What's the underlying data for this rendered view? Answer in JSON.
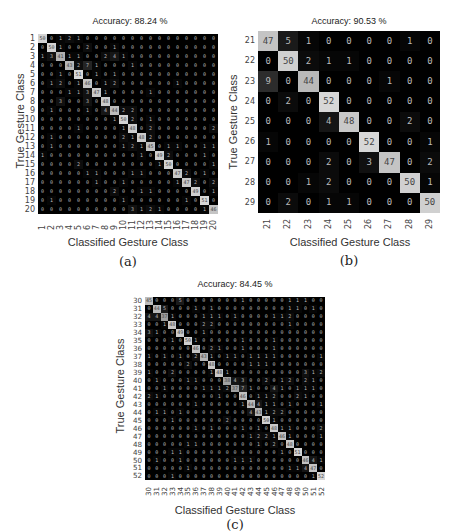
{
  "panels": {
    "a": {
      "caption": "(a)"
    },
    "b": {
      "caption": "(b)"
    },
    "c": {
      "caption": "(c)"
    }
  },
  "chart_data": [
    {
      "type": "heatmap",
      "id": "a",
      "title": "Accuracy: 88.24 %",
      "xlabel": "Classified Gesture Class",
      "ylabel": "True Gesture Class",
      "labels": [
        "1",
        "2",
        "3",
        "4",
        "5",
        "6",
        "7",
        "8",
        "9",
        "10",
        "11",
        "12",
        "13",
        "14",
        "15",
        "16",
        "17",
        "18",
        "19",
        "20"
      ],
      "matrix": [
        [
          50,
          0,
          1,
          2,
          1,
          0,
          0,
          0,
          0,
          0,
          0,
          0,
          0,
          0,
          0,
          0,
          0,
          0,
          0,
          0
        ],
        [
          0,
          50,
          1,
          0,
          0,
          2,
          0,
          0,
          1,
          0,
          0,
          0,
          0,
          0,
          0,
          0,
          0,
          0,
          0,
          0
        ],
        [
          1,
          3,
          41,
          1,
          1,
          0,
          0,
          2,
          4,
          1,
          0,
          0,
          0,
          0,
          0,
          0,
          0,
          0,
          0,
          0
        ],
        [
          0,
          0,
          0,
          43,
          2,
          7,
          1,
          0,
          0,
          0,
          1,
          0,
          0,
          0,
          0,
          0,
          0,
          0,
          0,
          0
        ],
        [
          0,
          0,
          1,
          0,
          51,
          0,
          1,
          0,
          1,
          0,
          0,
          0,
          0,
          0,
          0,
          0,
          0,
          0,
          0,
          0
        ],
        [
          0,
          1,
          2,
          0,
          1,
          46,
          0,
          1,
          2,
          0,
          0,
          0,
          0,
          0,
          0,
          1,
          0,
          0,
          0,
          0
        ],
        [
          0,
          0,
          0,
          1,
          1,
          3,
          47,
          1,
          0,
          0,
          0,
          0,
          1,
          0,
          0,
          0,
          0,
          0,
          0,
          0
        ],
        [
          0,
          0,
          3,
          0,
          0,
          3,
          0,
          48,
          0,
          0,
          0,
          0,
          0,
          0,
          0,
          0,
          0,
          0,
          0,
          0
        ],
        [
          0,
          1,
          0,
          0,
          0,
          1,
          0,
          4,
          44,
          2,
          2,
          0,
          0,
          0,
          0,
          0,
          0,
          0,
          0,
          0
        ],
        [
          0,
          0,
          0,
          0,
          0,
          0,
          0,
          0,
          1,
          50,
          2,
          0,
          1,
          0,
          0,
          0,
          0,
          0,
          0,
          0
        ],
        [
          0,
          0,
          0,
          0,
          1,
          0,
          0,
          0,
          0,
          1,
          48,
          0,
          2,
          0,
          0,
          0,
          0,
          0,
          0,
          2
        ],
        [
          0,
          1,
          0,
          0,
          0,
          0,
          0,
          0,
          0,
          2,
          1,
          48,
          2,
          0,
          0,
          0,
          0,
          0,
          0,
          0
        ],
        [
          0,
          1,
          0,
          0,
          0,
          0,
          0,
          0,
          0,
          1,
          2,
          1,
          45,
          0,
          1,
          1,
          0,
          0,
          1,
          1
        ],
        [
          1,
          0,
          0,
          0,
          0,
          0,
          0,
          0,
          0,
          0,
          0,
          1,
          0,
          49,
          2,
          0,
          0,
          0,
          1,
          0
        ],
        [
          0,
          0,
          0,
          0,
          2,
          0,
          0,
          0,
          0,
          0,
          0,
          0,
          0,
          1,
          50,
          0,
          0,
          0,
          0,
          1
        ],
        [
          0,
          0,
          0,
          0,
          0,
          1,
          1,
          0,
          0,
          0,
          1,
          1,
          0,
          0,
          0,
          47,
          2,
          0,
          1,
          0
        ],
        [
          0,
          0,
          0,
          0,
          0,
          0,
          1,
          0,
          0,
          1,
          0,
          0,
          0,
          0,
          0,
          1,
          47,
          2,
          0,
          2
        ],
        [
          0,
          0,
          0,
          0,
          0,
          0,
          0,
          0,
          2,
          0,
          0,
          1,
          1,
          0,
          0,
          0,
          0,
          49,
          0,
          1
        ],
        [
          0,
          1,
          0,
          0,
          0,
          0,
          0,
          0,
          0,
          1,
          0,
          0,
          0,
          0,
          0,
          0,
          1,
          0,
          51,
          0
        ],
        [
          0,
          0,
          0,
          0,
          0,
          0,
          0,
          0,
          0,
          0,
          3,
          1,
          2,
          1,
          0,
          0,
          0,
          0,
          1,
          46
        ]
      ]
    },
    {
      "type": "heatmap",
      "id": "b",
      "title": "Accuracy: 90.53 %",
      "xlabel": "Classified Gesture Class",
      "ylabel": "True Gesture Class",
      "labels": [
        "21",
        "22",
        "23",
        "24",
        "25",
        "26",
        "27",
        "28",
        "29"
      ],
      "matrix": [
        [
          47,
          5,
          1,
          0,
          0,
          0,
          0,
          1,
          0
        ],
        [
          0,
          50,
          2,
          1,
          1,
          0,
          0,
          0,
          0
        ],
        [
          9,
          0,
          44,
          0,
          0,
          0,
          1,
          0,
          0
        ],
        [
          0,
          2,
          0,
          52,
          0,
          0,
          0,
          0,
          0
        ],
        [
          0,
          0,
          0,
          4,
          48,
          0,
          0,
          2,
          0
        ],
        [
          1,
          0,
          0,
          0,
          0,
          52,
          0,
          0,
          1
        ],
        [
          0,
          0,
          0,
          2,
          0,
          3,
          47,
          0,
          2
        ],
        [
          0,
          0,
          1,
          2,
          0,
          0,
          0,
          50,
          1
        ],
        [
          0,
          2,
          0,
          1,
          1,
          0,
          0,
          0,
          50
        ]
      ]
    },
    {
      "type": "heatmap",
      "id": "c",
      "title": "Accuracy: 84.45 %",
      "xlabel": "Classified Gesture Class",
      "ylabel": "True Gesture Class",
      "labels": [
        "30",
        "31",
        "32",
        "33",
        "34",
        "35",
        "36",
        "37",
        "38",
        "39",
        "40",
        "41",
        "42",
        "43",
        "44",
        "45",
        "46",
        "47",
        "48",
        "49",
        "50",
        "51",
        "52"
      ],
      "matrix": [
        [
          45,
          0,
          0,
          0,
          5,
          0,
          0,
          0,
          0,
          0,
          0,
          0,
          1,
          0,
          0,
          0,
          0,
          0,
          1,
          1,
          1,
          0,
          0
        ],
        [
          0,
          44,
          5,
          0,
          0,
          0,
          1,
          0,
          1,
          0,
          0,
          0,
          0,
          0,
          0,
          0,
          0,
          0,
          1,
          1,
          0,
          1,
          0
        ],
        [
          4,
          4,
          37,
          1,
          0,
          0,
          0,
          1,
          1,
          1,
          0,
          1,
          0,
          0,
          0,
          0,
          1,
          1,
          2,
          0,
          0,
          0,
          0
        ],
        [
          0,
          0,
          1,
          48,
          0,
          0,
          0,
          2,
          2,
          0,
          0,
          0,
          0,
          0,
          0,
          0,
          0,
          0,
          1,
          0,
          0,
          0,
          0
        ],
        [
          3,
          1,
          0,
          0,
          49,
          0,
          0,
          1,
          0,
          0,
          0,
          0,
          0,
          0,
          0,
          0,
          0,
          0,
          0,
          0,
          0,
          0,
          0
        ],
        [
          0,
          0,
          0,
          1,
          0,
          50,
          1,
          0,
          0,
          0,
          0,
          0,
          1,
          0,
          0,
          0,
          1,
          0,
          0,
          0,
          0,
          0,
          0
        ],
        [
          0,
          0,
          0,
          0,
          0,
          0,
          46,
          0,
          2,
          1,
          0,
          0,
          1,
          0,
          0,
          0,
          1,
          0,
          0,
          0,
          0,
          0,
          0
        ],
        [
          1,
          0,
          1,
          0,
          1,
          0,
          2,
          43,
          1,
          0,
          1,
          1,
          0,
          1,
          1,
          1,
          1,
          0,
          0,
          0,
          0,
          0,
          1
        ],
        [
          0,
          0,
          0,
          0,
          0,
          2,
          0,
          0,
          48,
          0,
          0,
          0,
          0,
          1,
          1,
          1,
          0,
          0,
          0,
          0,
          0,
          0,
          0
        ],
        [
          1,
          0,
          0,
          2,
          0,
          0,
          0,
          0,
          1,
          48,
          1,
          0,
          0,
          0,
          0,
          0,
          0,
          0,
          0,
          0,
          3,
          1,
          2
        ],
        [
          0,
          1,
          0,
          0,
          0,
          1,
          1,
          0,
          0,
          0,
          38,
          4,
          3,
          0,
          0,
          2,
          0,
          1,
          2,
          0,
          2,
          1,
          0
        ],
        [
          0,
          0,
          1,
          0,
          0,
          0,
          0,
          1,
          1,
          1,
          2,
          37,
          7,
          1,
          0,
          0,
          4,
          1,
          0,
          1,
          1,
          1,
          0
        ],
        [
          2,
          1,
          0,
          0,
          0,
          0,
          0,
          0,
          0,
          1,
          0,
          0,
          46,
          0,
          1,
          1,
          2,
          0,
          0,
          2,
          1,
          0,
          0
        ],
        [
          0,
          0,
          0,
          0,
          0,
          0,
          1,
          0,
          0,
          0,
          0,
          0,
          1,
          44,
          4,
          1,
          1,
          0,
          1,
          0,
          0,
          0,
          1
        ],
        [
          0,
          1,
          1,
          0,
          1,
          0,
          0,
          0,
          0,
          0,
          0,
          0,
          0,
          4,
          43,
          1,
          2,
          2,
          0,
          0,
          0,
          0,
          0
        ],
        [
          0,
          0,
          0,
          1,
          0,
          0,
          0,
          0,
          0,
          0,
          2,
          0,
          0,
          0,
          0,
          50,
          1,
          0,
          0,
          0,
          0,
          0,
          0
        ],
        [
          0,
          0,
          0,
          0,
          0,
          0,
          1,
          0,
          1,
          0,
          0,
          0,
          1,
          0,
          1,
          0,
          48,
          1,
          1,
          0,
          0,
          0,
          2
        ],
        [
          0,
          0,
          0,
          0,
          0,
          0,
          0,
          0,
          0,
          0,
          0,
          0,
          0,
          1,
          2,
          2,
          1,
          46,
          1,
          0,
          0,
          0,
          1
        ],
        [
          0,
          0,
          0,
          0,
          0,
          1,
          1,
          0,
          0,
          0,
          0,
          0,
          0,
          0,
          1,
          0,
          2,
          0,
          48,
          0,
          0,
          0,
          0
        ],
        [
          0,
          0,
          0,
          1,
          1,
          0,
          0,
          0,
          0,
          0,
          0,
          0,
          0,
          0,
          0,
          0,
          0,
          1,
          0,
          51,
          0,
          0,
          0
        ],
        [
          0,
          1,
          0,
          0,
          1,
          0,
          0,
          0,
          0,
          0,
          0,
          1,
          1,
          1,
          0,
          0,
          0,
          0,
          0,
          0,
          46,
          4,
          1
        ],
        [
          0,
          0,
          0,
          0,
          0,
          1,
          0,
          0,
          0,
          0,
          0,
          0,
          0,
          0,
          0,
          0,
          0,
          0,
          1,
          1,
          4,
          47,
          0
        ],
        [
          0,
          0,
          0,
          1,
          0,
          0,
          0,
          0,
          0,
          0,
          0,
          0,
          0,
          0,
          0,
          0,
          0,
          0,
          0,
          0,
          0,
          1,
          52
        ]
      ]
    }
  ]
}
